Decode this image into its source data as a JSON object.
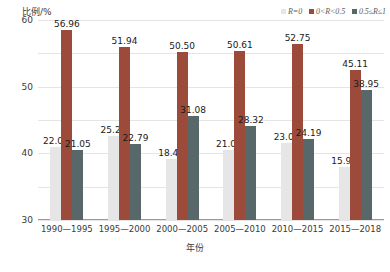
{
  "chart_data": {
    "type": "bar",
    "title": "",
    "xlabel": "年份",
    "ylabel": "比例/%",
    "ylim": [
      0,
      60
    ],
    "yticks": [
      "0",
      "10",
      "20",
      "30",
      "40",
      "50",
      "60"
    ],
    "grid": true,
    "legend_position": "top-right",
    "categories": [
      "1990—1995",
      "1995—2000",
      "2000—2005",
      "2005—2010",
      "2010—2015",
      "2015—2018"
    ],
    "series": [
      {
        "name": "R=0",
        "color": "#e6e6e6",
        "values": [
          22.0,
          25.27,
          18.42,
          21.06,
          23.07,
          15.94
        ],
        "labels": [
          "22.00",
          "25.27",
          "18.42",
          "21.06",
          "23.07",
          "15.94"
        ]
      },
      {
        "name": "0<R<0.5",
        "color": "#9c4b3b",
        "values": [
          56.96,
          51.94,
          50.5,
          50.61,
          52.75,
          45.11
        ],
        "labels": [
          "56.96",
          "51.94",
          "50.50",
          "50.61",
          "52.75",
          "45.11"
        ]
      },
      {
        "name": "0.5≤R≤1",
        "color": "#58686a",
        "values": [
          21.05,
          22.79,
          31.08,
          28.32,
          24.19,
          38.95
        ],
        "labels": [
          "21.05",
          "22.79",
          "31.08",
          "28.32",
          "24.19",
          "38.95"
        ]
      }
    ]
  },
  "legend": {
    "items": [
      {
        "label": "R=0",
        "color": "#e6e6e6"
      },
      {
        "label": "0<R<0.5",
        "color": "#9c4b3b"
      },
      {
        "label": "0.5≤R≤1",
        "color": "#58686a"
      }
    ]
  }
}
